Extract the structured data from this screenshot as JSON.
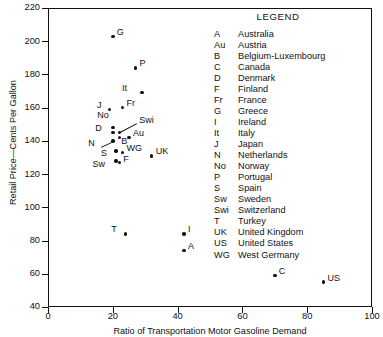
{
  "chart_data": {
    "type": "scatter",
    "title": "",
    "xlabel": "Ratio of Transportation Motor Gasoline Demand",
    "ylabel": "Retail Price—Cents Per Gallon",
    "xlim": [
      0,
      100
    ],
    "ylim": [
      40,
      220
    ],
    "xticks": [
      0,
      20,
      40,
      60,
      80,
      100
    ],
    "yticks": [
      40,
      60,
      80,
      100,
      120,
      140,
      160,
      180,
      200,
      220
    ],
    "grid": false,
    "legend_position": "inside-top-right",
    "points": [
      {
        "code": "G",
        "name": "Greece",
        "x": 20,
        "y": 203,
        "label_dx": 4,
        "label_dy": -4
      },
      {
        "code": "P",
        "name": "Portugal",
        "x": 27,
        "y": 184,
        "label_dx": 4,
        "label_dy": -4
      },
      {
        "code": "It",
        "name": "Italy",
        "x": 29,
        "y": 169,
        "label_dx": -15,
        "label_dy": -4
      },
      {
        "code": "Fr",
        "name": "France",
        "x": 23,
        "y": 160,
        "label_dx": 4,
        "label_dy": -4
      },
      {
        "code": "J",
        "name": "Japan",
        "x": 19,
        "y": 159,
        "label_dx": -8,
        "label_dy": -4
      },
      {
        "code": "No",
        "name": "Norway",
        "x": 20,
        "y": 148,
        "label_dx": -4,
        "label_dy": -12
      },
      {
        "code": "Swi",
        "name": "Switzerland",
        "x": 22,
        "y": 145,
        "label_dx": 20,
        "label_dy": -12
      },
      {
        "code": "D",
        "name": "Denmark",
        "x": 20,
        "y": 145,
        "label_dx": -11,
        "label_dy": -4
      },
      {
        "code": "B",
        "name": "Belgium-Luxembourg",
        "x": 22,
        "y": 142,
        "label_dx": 2,
        "label_dy": 4
      },
      {
        "code": "Au",
        "name": "Austria",
        "x": 25,
        "y": 142,
        "label_dx": 4,
        "label_dy": -4
      },
      {
        "code": "N",
        "name": "Netherlands",
        "x": 20,
        "y": 140,
        "label_dx": -18,
        "label_dy": 3
      },
      {
        "code": "S",
        "name": "Spain",
        "x": 21,
        "y": 134,
        "label_dx": -9,
        "label_dy": 3
      },
      {
        "code": "WG",
        "name": "West Germany",
        "x": 23,
        "y": 133,
        "label_dx": 4,
        "label_dy": -4
      },
      {
        "code": "UK",
        "name": "United Kingdom",
        "x": 32,
        "y": 131,
        "label_dx": 4,
        "label_dy": -4
      },
      {
        "code": "Sw",
        "name": "Sweden",
        "x": 21,
        "y": 128,
        "label_dx": -11,
        "label_dy": 4
      },
      {
        "code": "F",
        "name": "Finland",
        "x": 22,
        "y": 127,
        "label_dx": 4,
        "label_dy": -3
      },
      {
        "code": "T",
        "name": "Turkey",
        "x": 24,
        "y": 84,
        "label_dx": -9,
        "label_dy": -4
      },
      {
        "code": "I",
        "name": "Ireland",
        "x": 42,
        "y": 84,
        "label_dx": 4,
        "label_dy": -4
      },
      {
        "code": "A",
        "name": "Australia",
        "x": 42,
        "y": 74,
        "label_dx": 4,
        "label_dy": -4
      },
      {
        "code": "C",
        "name": "Canada",
        "x": 70,
        "y": 59,
        "label_dx": 4,
        "label_dy": -4
      },
      {
        "code": "US",
        "name": "United States",
        "x": 85,
        "y": 55,
        "label_dx": 4,
        "label_dy": -4
      }
    ]
  },
  "legend": {
    "title": "LEGEND",
    "entries": [
      {
        "code": "A",
        "name": "Australia"
      },
      {
        "code": "Au",
        "name": "Austria"
      },
      {
        "code": "B",
        "name": "Belgium-Luxembourg"
      },
      {
        "code": "C",
        "name": "Canada"
      },
      {
        "code": "D",
        "name": "Denmark"
      },
      {
        "code": "F",
        "name": "Finland"
      },
      {
        "code": "Fr",
        "name": "France"
      },
      {
        "code": "G",
        "name": "Greece"
      },
      {
        "code": "I",
        "name": "Ireland"
      },
      {
        "code": "It",
        "name": "Italy"
      },
      {
        "code": "J",
        "name": "Japan"
      },
      {
        "code": "N",
        "name": "Netherlands"
      },
      {
        "code": "No",
        "name": "Norway"
      },
      {
        "code": "P",
        "name": "Portugal"
      },
      {
        "code": "S",
        "name": "Spain"
      },
      {
        "code": "Sw",
        "name": "Sweden"
      },
      {
        "code": "Swi",
        "name": "Switzerland"
      },
      {
        "code": "T",
        "name": "Turkey"
      },
      {
        "code": "UK",
        "name": "United Kingdom"
      },
      {
        "code": "US",
        "name": "United States"
      },
      {
        "code": "WG",
        "name": "West Germany"
      }
    ]
  }
}
